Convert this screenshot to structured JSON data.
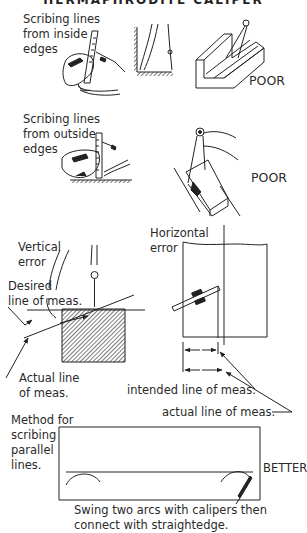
{
  "page": {
    "title": "HERMAPHRODITE CALIPER"
  },
  "section1": {
    "caption_lines": [
      "Scribing lines",
      "from inside",
      "edges"
    ],
    "rating": "POOR"
  },
  "section2": {
    "caption_lines": [
      "Scribing lines",
      "from outside",
      "edges"
    ],
    "rating": "POOR"
  },
  "section3": {
    "vertical_error_lines": [
      "Vertical",
      "error"
    ],
    "desired_line_lines": [
      "Desired",
      "line of meas."
    ],
    "actual_line_lines": [
      "Actual line",
      "of meas."
    ],
    "horizontal_error_lines": [
      "Horizontal",
      "error"
    ],
    "intended_line_label": "intended line of meas.",
    "actual_line_label": "actual line of meas."
  },
  "section4": {
    "method_lines": [
      "Method for",
      "scribing",
      "parallel",
      "lines."
    ],
    "rating": "BETTER",
    "instruction_lines": [
      "Swing two arcs with calipers then",
      "connect with straightedge."
    ]
  }
}
